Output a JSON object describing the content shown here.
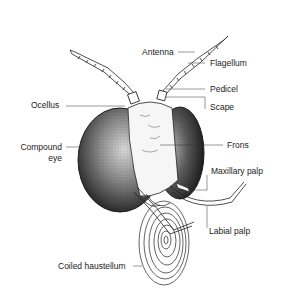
{
  "diagram": {
    "colors": {
      "background": "#ffffff",
      "ink": "#222222",
      "eye_dark": "#2a2a2a",
      "eye_light": "#cfcfcf"
    },
    "labels": {
      "antenna": "Antenna",
      "flagellum": "Flagellum",
      "pedicel": "Pedicel",
      "scape": "Scape",
      "ocellus": "Ocellus",
      "frons": "Frons",
      "compound_eye_line1": "Compound",
      "compound_eye_line2": "eye",
      "maxillary_palp": "Maxillary palp",
      "labial_palp": "Labial palp",
      "coiled_haustellum": "Coiled haustellum"
    }
  }
}
